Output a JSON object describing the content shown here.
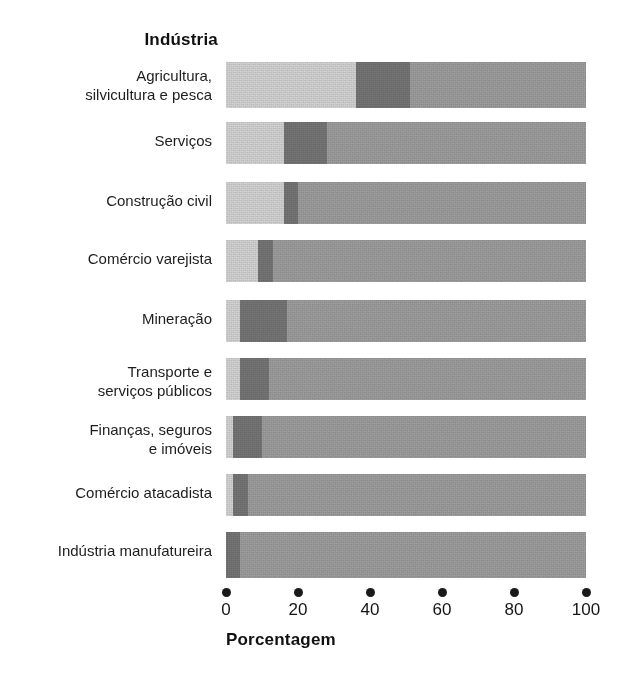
{
  "legend_title": "Indústria",
  "axis": {
    "title": "Porcentagem",
    "ticks": [
      "0",
      "20",
      "40",
      "60",
      "80",
      "100"
    ],
    "min": 0,
    "max": 100
  },
  "colors": {
    "segment_light": "#d4d4d4",
    "segment_dark": "#767676",
    "segment_medium": "#9e9e9e",
    "text": "#1b1b1b",
    "background": "#ffffff"
  },
  "chart_data": {
    "type": "bar",
    "orientation": "horizontal",
    "stacked": true,
    "normalized_percent": true,
    "title": "",
    "xlabel": "Porcentagem",
    "ylabel": "Indústria",
    "xlim": [
      0,
      100
    ],
    "xticks": [
      0,
      20,
      40,
      60,
      80,
      100
    ],
    "grid": false,
    "legend": "none",
    "categories": [
      "Agricultura,\nsilvicultura e pesca",
      "Serviços",
      "Construção civil",
      "Comércio varejista",
      "Mineração",
      "Transporte e\nserviços públicos",
      "Finanças, seguros\ne imóveis",
      "Comércio atacadista",
      "Indústria manufatureira"
    ],
    "series": [
      {
        "name": "segmento-claro",
        "color": "#d4d4d4",
        "values": [
          36,
          16,
          16,
          9,
          4,
          4,
          2,
          2,
          0
        ]
      },
      {
        "name": "segmento-escuro",
        "color": "#767676",
        "values": [
          15,
          12,
          4,
          4,
          13,
          8,
          8,
          4,
          4
        ]
      },
      {
        "name": "segmento-medio",
        "color": "#9e9e9e",
        "values": [
          49,
          72,
          80,
          87,
          83,
          88,
          90,
          94,
          96
        ]
      }
    ]
  }
}
